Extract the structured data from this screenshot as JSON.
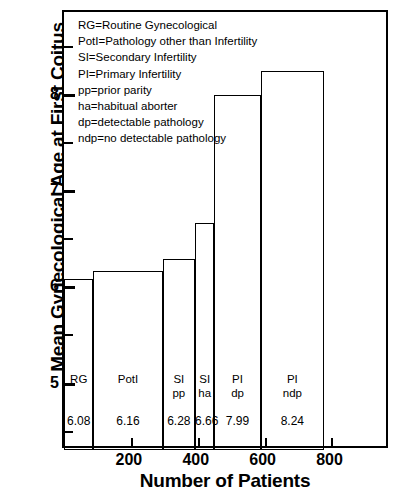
{
  "chart_data": {
    "type": "bar",
    "title": "",
    "xlabel": "Number of Patients",
    "ylabel": "Mean Gynecological Age at First Coitus",
    "xlim": [
      0,
      975
    ],
    "ylim": [
      4.3,
      8.85
    ],
    "grid": false,
    "legend_position": "inside-top-left",
    "note": "Histogram-style bars: bar width is proportional to number of patients; bar height is mean gynecological age at first coitus.",
    "x_ticks": [
      200,
      400,
      600,
      800
    ],
    "x_tick_labels": [
      "200",
      "400",
      "600",
      "800"
    ],
    "y_ticks": [
      5,
      6,
      7,
      8
    ],
    "y_tick_labels": [
      "5",
      "6",
      "7",
      "8"
    ],
    "y_minor_ticks": [
      4.5,
      5.5,
      6.5,
      7.5,
      8.5
    ],
    "categories": [
      "RG",
      "PotI",
      "SI pp",
      "SI ha",
      "PI dp",
      "PI ndp"
    ],
    "values": [
      6.08,
      6.16,
      6.28,
      6.66,
      7.99,
      8.24
    ],
    "value_labels": [
      "6.08",
      "6.16",
      "6.28",
      "6.66",
      "7.99",
      "8.24"
    ],
    "bars": [
      {
        "label_line1": "RG",
        "label_line2": "",
        "value": 6.08,
        "value_label": "6.08",
        "x_start": 0,
        "x_end": 88,
        "n_patients": 88
      },
      {
        "label_line1": "PotI",
        "label_line2": "",
        "value": 6.16,
        "value_label": "6.16",
        "x_start": 88,
        "x_end": 295,
        "n_patients": 207
      },
      {
        "label_line1": "SI",
        "label_line2": "pp",
        "value": 6.28,
        "value_label": "6.28",
        "x_start": 295,
        "x_end": 392,
        "n_patients": 97
      },
      {
        "label_line1": "SI",
        "label_line2": "ha",
        "value": 6.66,
        "value_label": "6.66",
        "x_start": 392,
        "x_end": 450,
        "n_patients": 58
      },
      {
        "label_line1": "PI",
        "label_line2": "dp",
        "value": 7.99,
        "value_label": "7.99",
        "x_start": 450,
        "x_end": 588,
        "n_patients": 138
      },
      {
        "label_line1": "PI",
        "label_line2": "ndp",
        "value": 8.24,
        "value_label": "8.24",
        "x_start": 588,
        "x_end": 778,
        "n_patients": 190
      }
    ]
  },
  "legend": {
    "lines": [
      "RG=Routine Gynecological",
      "PotI=Pathology other than Infertility",
      "SI=Secondary Infertility",
      "PI=Primary Infertility",
      "pp=prior parity",
      "ha=habitual aborter",
      "dp=detectable pathology",
      "ndp=no detectable pathology"
    ]
  },
  "colors": {
    "axis": "#000000",
    "bar_stroke": "#000000",
    "bar_fill": "#ffffff",
    "background": "#ffffff",
    "text": "#000000"
  }
}
